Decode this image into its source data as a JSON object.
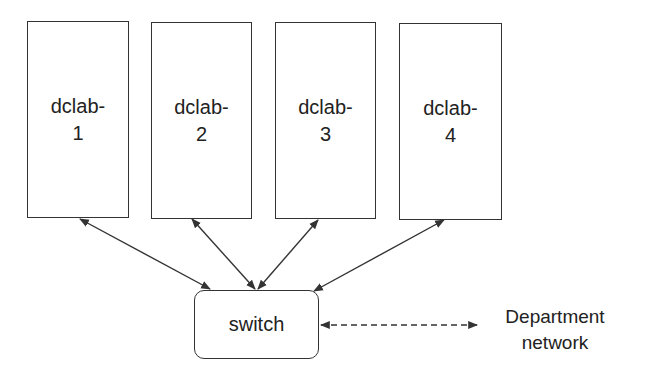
{
  "diagram": {
    "hosts": [
      {
        "line1": "dclab-",
        "line2": "1"
      },
      {
        "line1": "dclab-",
        "line2": "2"
      },
      {
        "line1": "dclab-",
        "line2": "3"
      },
      {
        "line1": "dclab-",
        "line2": "4"
      }
    ],
    "switch": {
      "label": "switch"
    },
    "external": {
      "line1": "Department",
      "line2": "network"
    },
    "edges": [
      {
        "from": "dclab-1",
        "to": "switch",
        "style": "solid",
        "direction": "bidirectional"
      },
      {
        "from": "dclab-2",
        "to": "switch",
        "style": "solid",
        "direction": "bidirectional"
      },
      {
        "from": "dclab-3",
        "to": "switch",
        "style": "solid",
        "direction": "bidirectional"
      },
      {
        "from": "dclab-4",
        "to": "switch",
        "style": "solid",
        "direction": "bidirectional"
      },
      {
        "from": "switch",
        "to": "Department network",
        "style": "dashed",
        "direction": "bidirectional"
      }
    ],
    "colors": {
      "stroke": "#333333",
      "background": "#ffffff",
      "text": "#222222"
    }
  }
}
